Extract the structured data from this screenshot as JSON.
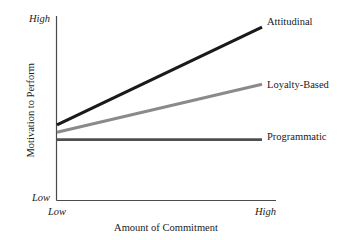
{
  "chart_data": {
    "type": "line",
    "title": "",
    "xlabel": "Amount of Commitment",
    "ylabel": "Motivation to Perform",
    "x_tick_labels": [
      "Low",
      "High"
    ],
    "y_tick_labels": [
      "Low",
      "High"
    ],
    "xlim": [
      0,
      1
    ],
    "ylim": [
      0,
      1
    ],
    "grid": false,
    "legend_position": "right-of-line-ends",
    "x": [
      0,
      1
    ],
    "series": [
      {
        "name": "Attitudinal",
        "values": [
          0.41,
          0.94
        ],
        "color": "#1a1a1a",
        "line_width": 3.2
      },
      {
        "name": "Loyalty-Based",
        "values": [
          0.37,
          0.63
        ],
        "color": "#8a8a8a",
        "line_width": 3.0
      },
      {
        "name": "Programmatic",
        "values": [
          0.33,
          0.33
        ],
        "color": "#4f4f4f",
        "line_width": 2.6
      }
    ],
    "axis_color": "#4a4a4a"
  },
  "axes": {
    "y_high_label": "High",
    "y_low_label": "Low",
    "x_low_label": "Low",
    "x_high_label": "High",
    "y_title": "Motivation to Perform",
    "x_title": "Amount of Commitment"
  },
  "labels": {
    "attitudinal": "Attitudinal",
    "loyalty": "Loyalty-Based",
    "programmatic": "Programmatic"
  }
}
